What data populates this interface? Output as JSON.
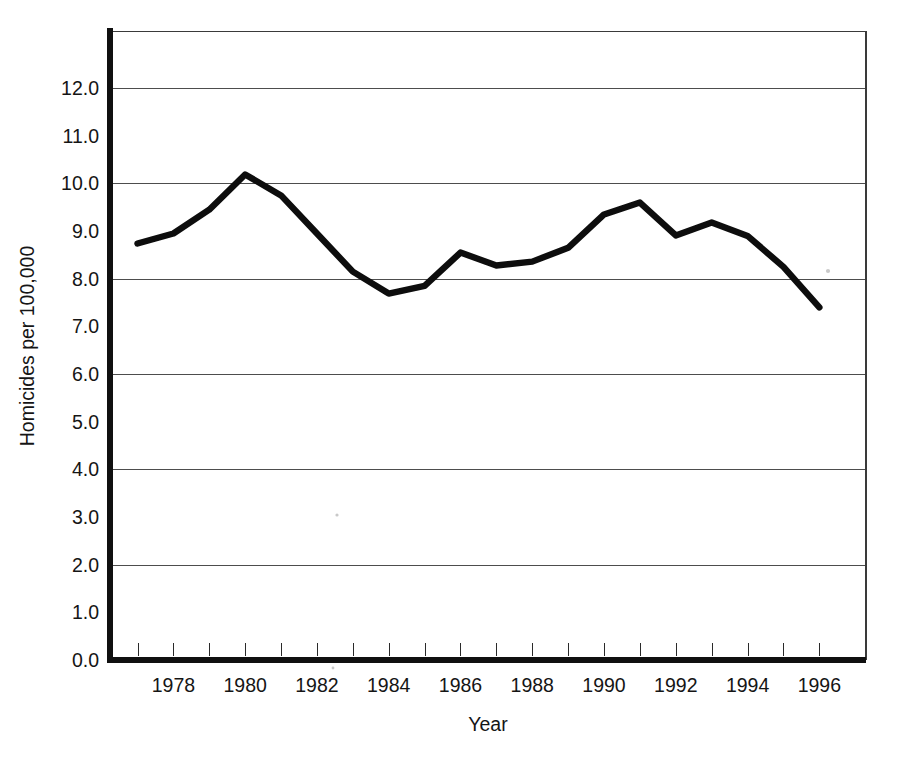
{
  "chart_data": {
    "type": "line",
    "title": "",
    "subtitle": "",
    "xlabel": "Year",
    "ylabel": "Homicides per 100,000",
    "x": [
      1977,
      1978,
      1979,
      1980,
      1981,
      1982,
      1983,
      1984,
      1985,
      1986,
      1987,
      1988,
      1989,
      1990,
      1991,
      1992,
      1993,
      1994,
      1995,
      1996
    ],
    "values": [
      8.74,
      8.95,
      9.45,
      10.19,
      9.75,
      8.95,
      8.15,
      7.69,
      7.85,
      8.55,
      8.28,
      8.36,
      8.65,
      9.35,
      9.6,
      8.91,
      9.18,
      8.9,
      8.25,
      7.4
    ],
    "series": [
      {
        "name": "Homicides per 100,000",
        "values": [
          8.74,
          8.95,
          9.45,
          10.19,
          9.75,
          8.95,
          8.15,
          7.69,
          7.85,
          8.55,
          8.28,
          8.36,
          8.65,
          9.35,
          9.6,
          8.91,
          9.18,
          8.9,
          8.25,
          7.4
        ]
      }
    ],
    "xlim": [
      1976.15,
      1997.3
    ],
    "ylim": [
      0.0,
      13.2
    ],
    "ytick_labels": [
      "0.0",
      "1.0",
      "2.0",
      "3.0",
      "4.0",
      "5.0",
      "6.0",
      "7.0",
      "8.0",
      "9.0",
      "10.0",
      "11.0",
      "12.0"
    ],
    "ytick_values": [
      0,
      1,
      2,
      3,
      4,
      5,
      6,
      7,
      8,
      9,
      10,
      11,
      12
    ],
    "xtick_labels": [
      "1978",
      "1980",
      "1982",
      "1984",
      "1986",
      "1988",
      "1990",
      "1992",
      "1994",
      "1996"
    ],
    "xtick_values": [
      1978,
      1980,
      1982,
      1984,
      1986,
      1988,
      1990,
      1992,
      1994,
      1996
    ],
    "xtick_minor_values": [
      1977,
      1978,
      1979,
      1980,
      1981,
      1982,
      1983,
      1984,
      1985,
      1986,
      1987,
      1988,
      1989,
      1990,
      1991,
      1992,
      1993,
      1994,
      1995,
      1996
    ],
    "gridlines": {
      "horizontal_at": [
        2,
        4,
        6,
        8,
        10,
        12
      ],
      "vertical": false,
      "color": "#4d4d4d"
    },
    "legend": null,
    "annotations": [],
    "line_color": "#0d0d0d",
    "background_color": "#ffffff"
  }
}
